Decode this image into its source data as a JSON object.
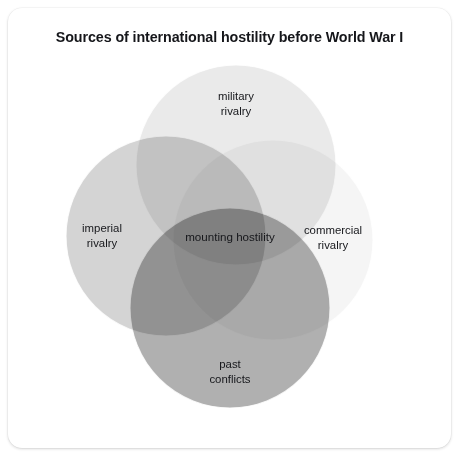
{
  "figure": {
    "title": "Sources of international hostility before World War I",
    "type": "venn-diagram",
    "circle_count": 4,
    "background_color": "#ffffff",
    "card_color": "#ffffff",
    "text_color": "#16171b"
  },
  "chart_data": {
    "type": "venn",
    "title": "Sources of international hostility before World War I",
    "sets": [
      {
        "id": "military",
        "label_line1": "military",
        "label_line2": "rivalry",
        "label": "military rivalry",
        "fill": "#d8d8d8",
        "opacity": 0.55,
        "cx": 228,
        "cy": 157,
        "r": 100,
        "label_x": 228,
        "label_y": 96
      },
      {
        "id": "imperial",
        "label_line1": "imperial",
        "label_line2": "rivalry",
        "label": "imperial rivalry",
        "fill": "#b9b9b9",
        "opacity": 0.62,
        "cx": 158,
        "cy": 228,
        "r": 100,
        "label_x": 94,
        "label_y": 228
      },
      {
        "id": "commercial",
        "label_line1": "commercial",
        "label_line2": "rivalry",
        "label": "commercial rivalry",
        "fill": "#ececec",
        "opacity": 0.55,
        "cx": 265,
        "cy": 232,
        "r": 100,
        "label_x": 325,
        "label_y": 230
      },
      {
        "id": "past",
        "label_line1": "past",
        "label_line2": "conflicts",
        "label": "past conflicts",
        "fill": "#8f8f8f",
        "opacity": 0.7,
        "cx": 222,
        "cy": 300,
        "r": 100,
        "label_x": 222,
        "label_y": 364
      }
    ],
    "intersection": {
      "id": "mounting-hostility",
      "label": "mounting hostility",
      "label_x": 222,
      "label_y": 229
    },
    "palette": {
      "military_alone": "#e8e8e8",
      "imperial_alone": "#cbcbcb",
      "commercial_alone": "#f6f6f6",
      "past_alone": "#969696",
      "darkest_overlap": "#747474",
      "center_overlap": "#a8a8a8"
    }
  }
}
